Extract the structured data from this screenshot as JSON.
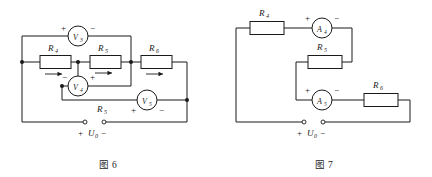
{
  "document": {
    "type": "electrical-circuit-diagram-pair",
    "background_color": "#ffffff",
    "line_color": "#1a1a1a"
  },
  "figure6": {
    "caption": "图 6",
    "source_label": "U",
    "source_subscript": "0",
    "source_plus": "+",
    "source_minus": "−",
    "components": [
      {
        "id": "R4",
        "label": "R",
        "subscript": "4",
        "type": "rheostat",
        "has_arrow": true
      },
      {
        "id": "R5_top",
        "label": "R",
        "subscript": "5",
        "type": "rheostat",
        "has_arrow": true
      },
      {
        "id": "R6",
        "label": "R",
        "subscript": "6",
        "type": "rheostat",
        "has_arrow": true
      },
      {
        "id": "R5_bottom",
        "label": "R",
        "subscript": "5",
        "type": "wire-label",
        "has_arrow": false
      }
    ],
    "meters": [
      {
        "id": "V3",
        "label": "V",
        "subscript": "3",
        "type": "voltmeter",
        "left_sign": "+",
        "right_sign": "−"
      },
      {
        "id": "V4",
        "label": "V",
        "subscript": "4",
        "type": "voltmeter",
        "left_sign": "−",
        "right_sign": "+"
      },
      {
        "id": "V5",
        "label": "V",
        "subscript": "5",
        "type": "voltmeter",
        "left_sign": "+",
        "right_sign": "−"
      }
    ]
  },
  "figure7": {
    "caption": "图 7",
    "source_label": "U",
    "source_subscript": "0",
    "source_plus": "+",
    "source_minus": "−",
    "components": [
      {
        "id": "R4",
        "label": "R",
        "subscript": "4",
        "type": "resistor",
        "has_arrow": false
      },
      {
        "id": "R5",
        "label": "R",
        "subscript": "5",
        "type": "resistor",
        "has_arrow": false
      },
      {
        "id": "R6",
        "label": "R",
        "subscript": "6",
        "type": "resistor",
        "has_arrow": false
      }
    ],
    "meters": [
      {
        "id": "A4",
        "label": "A",
        "subscript": "4",
        "type": "ammeter",
        "left_sign": "+",
        "right_sign": "−"
      },
      {
        "id": "A5",
        "label": "A",
        "subscript": "5",
        "type": "ammeter",
        "left_sign": "+",
        "right_sign": "−"
      }
    ]
  }
}
